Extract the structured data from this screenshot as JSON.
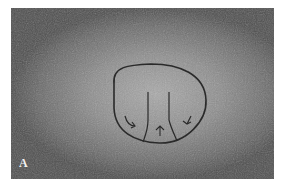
{
  "figure": {
    "panel_label": "A",
    "colors": {
      "background": "#ffffff",
      "skin_light": "#a9a9a9",
      "skin_dark": "#4e4e4e",
      "ink": "#2a2a2a"
    }
  }
}
